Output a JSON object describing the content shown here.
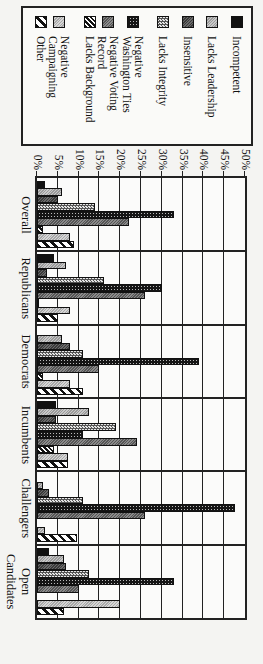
{
  "chart_data": {
    "type": "bar",
    "orientation": "vertical bars, image rotated 90 degrees clockwise",
    "title": "",
    "xlabel": "",
    "ylabel": "Negative Traits Stressed by Candidates",
    "ylim": [
      0,
      50
    ],
    "yticks": [
      "0%",
      "5%",
      "10%",
      "15%",
      "20%",
      "25%",
      "30%",
      "35%",
      "40%",
      "45%",
      "50%"
    ],
    "grid": true,
    "legend_position": "right (top of rotated image)",
    "categories": [
      "Overall",
      "Republicans",
      "Democrats",
      "Incumbents",
      "Challengers",
      "Open Candidates"
    ],
    "series": [
      {
        "name": "Incompetent",
        "pattern": "solid-black",
        "values": [
          2,
          4,
          0,
          4.5,
          0,
          3
        ]
      },
      {
        "name": "Lacks Leadership",
        "pattern": "light-gray",
        "values": [
          6,
          7,
          6,
          12.5,
          1.5,
          6.5
        ]
      },
      {
        "name": "Insensitive",
        "pattern": "dark-gray",
        "values": [
          5,
          2.5,
          8,
          4.5,
          3,
          7
        ]
      },
      {
        "name": "Lacks Integrity",
        "pattern": "checker-light",
        "values": [
          14,
          16,
          11,
          19,
          11,
          12.5
        ]
      },
      {
        "name": "Negative Washington Ties",
        "pattern": "dotted-black",
        "values": [
          33,
          30,
          39,
          11,
          47.5,
          33
        ]
      },
      {
        "name": "Negative Voting Record",
        "pattern": "medium-gray",
        "values": [
          22,
          26,
          15,
          24,
          26,
          10
        ]
      },
      {
        "name": "Lacks Background",
        "pattern": "diagonal-stripe",
        "values": [
          1.5,
          0.5,
          1.5,
          4,
          0,
          0
        ]
      },
      {
        "name": "Negative Campaigning",
        "pattern": "pale-gray",
        "values": [
          8,
          8,
          8,
          7.5,
          2,
          20
        ]
      },
      {
        "name": "Other",
        "pattern": "wide-diagonal",
        "values": [
          9,
          5,
          11,
          7.5,
          9.5,
          6.5
        ]
      }
    ]
  },
  "legend": {
    "items": [
      {
        "label": "Incompetent"
      },
      {
        "label": "Lacks Leadership"
      },
      {
        "label": "Insensitive"
      },
      {
        "label": "Lacks Integrity"
      },
      {
        "label": "Negative\nWashington Ties"
      },
      {
        "label": "Negative Voting\nRecord"
      },
      {
        "label": "Lacks Background"
      },
      {
        "label": "Negative\nCampaigning"
      },
      {
        "label": "Other"
      }
    ]
  },
  "axis": {
    "ylabel": "Negative Traits Stressed by Candidates",
    "ticks": [
      "0%",
      "5%",
      "10%",
      "15%",
      "20%",
      "25%",
      "30%",
      "35%",
      "40%",
      "45%",
      "50%"
    ]
  },
  "groups": [
    "Overall",
    "Republicans",
    "Democrats",
    "Incumbents",
    "Challengers",
    "Open Candidates"
  ]
}
